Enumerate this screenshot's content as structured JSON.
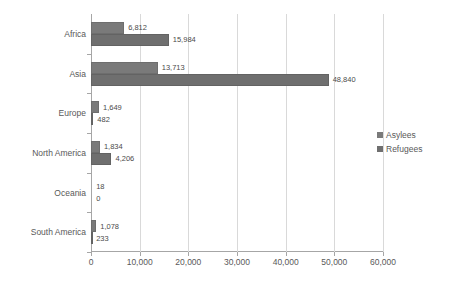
{
  "chart_data": {
    "type": "bar",
    "orientation": "horizontal",
    "title": "",
    "xlabel": "",
    "ylabel": "",
    "xlim": [
      0,
      60000
    ],
    "xticks": [
      "0",
      "10,000",
      "20,000",
      "30,000",
      "40,000",
      "50,000",
      "60,000"
    ],
    "xtick_values": [
      0,
      10000,
      20000,
      30000,
      40000,
      50000,
      60000
    ],
    "grid": "vertical",
    "legend_position": "right",
    "categories": [
      "Africa",
      "Asia",
      "Europe",
      "North America",
      "Oceania",
      "South America"
    ],
    "series": [
      {
        "name": "Asylees",
        "color": "#7a7a7a",
        "values": [
          6812,
          13713,
          1649,
          1834,
          18,
          1078
        ],
        "labels": [
          "6,812",
          "13,713",
          "1,649",
          "1,834",
          "18",
          "1,078"
        ]
      },
      {
        "name": "Refugees",
        "color": "#6f6f6f",
        "values": [
          15984,
          48840,
          482,
          4206,
          0,
          233
        ],
        "labels": [
          "15,984",
          "48,840",
          "482",
          "4,206",
          "0",
          "233"
        ]
      }
    ]
  },
  "legend": {
    "items": [
      {
        "label": "Asylees"
      },
      {
        "label": "Refugees"
      }
    ]
  }
}
